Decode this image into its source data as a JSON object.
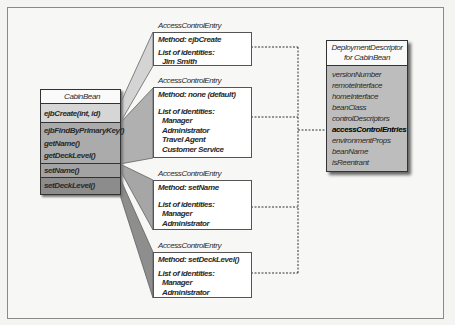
{
  "cabin_bean": {
    "title": "CabinBean",
    "rows": [
      {
        "label": "ejbCreate(int, id)",
        "shade": "#d6d6d6"
      },
      {
        "group": [
          "ejbFindByPrimaryKey()",
          "getName()",
          "getDeckLevel()"
        ],
        "shade": "#ababab"
      },
      {
        "label": "setName()",
        "shade": "#a3a3a3"
      },
      {
        "label": "setDeckLevel()",
        "shade": "#8c8c8c"
      }
    ]
  },
  "entries": [
    {
      "label": "AccessControlEntry",
      "method": "Method: ejbCreate",
      "identities_label": "List of identities:",
      "identities": [
        "Jim Smith"
      ],
      "wedge_color": "#d4d4d4"
    },
    {
      "label": "AccessControlEntry",
      "method": "Method: none (default)",
      "identities_label": "List of identities:",
      "identities": [
        "Manager",
        "Administrator",
        "Travel Agent",
        "Customer Service"
      ],
      "wedge_color": "#b0b0b0"
    },
    {
      "label": "AccessControlEntry",
      "method": "Method: setName",
      "identities_label": "List of identities:",
      "identities": [
        "Manager",
        "Administrator"
      ],
      "wedge_color": "#a6a6a6"
    },
    {
      "label": "AccessControlEntry",
      "method": "Method: setDeckLevel()",
      "identities_label": "List of identities:",
      "identities": [
        "Manager",
        "Administrator"
      ],
      "wedge_color": "#8e8e8e"
    }
  ],
  "deployment_descriptor": {
    "title_line1": "DeploymentDescriptor",
    "title_line2": "for CabinBean",
    "properties": [
      "versionNumber",
      "remoteInterface",
      "homeInterface",
      "beanClass",
      "controlDescriptors",
      "accessControlEntries",
      "environmentProps",
      "beanName",
      "isReentrant"
    ],
    "highlighted": "accessControlEntries"
  }
}
